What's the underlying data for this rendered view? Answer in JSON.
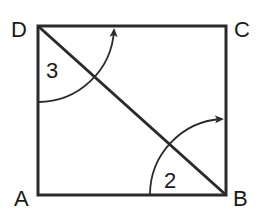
{
  "diagram": {
    "type": "geometry-square-with-diagonal",
    "stroke_color": "#2a2a2a",
    "vertices": [
      {
        "label": "D",
        "x": 38,
        "y": 26
      },
      {
        "label": "C",
        "x": 226,
        "y": 26
      },
      {
        "label": "A",
        "x": 38,
        "y": 195
      },
      {
        "label": "B",
        "x": 226,
        "y": 195
      }
    ],
    "diagonal": {
      "from": "D",
      "to": "B"
    },
    "angles": [
      {
        "label": "3",
        "vertex": "D",
        "direction": "counterclockwise from DA to DC"
      },
      {
        "label": "2",
        "vertex": "B",
        "direction": "counterclockwise from BA to BC"
      }
    ]
  },
  "labels": {
    "D": "D",
    "C": "C",
    "A": "A",
    "B": "B",
    "angle3": "3",
    "angle2": "2"
  }
}
